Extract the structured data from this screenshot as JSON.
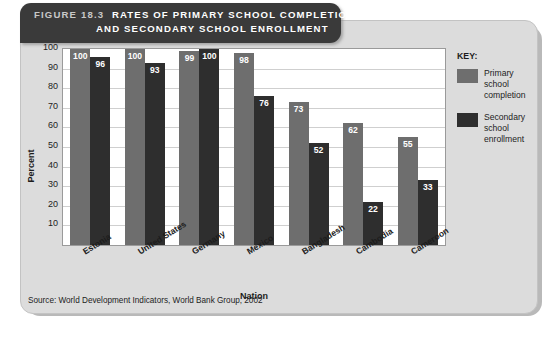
{
  "figure": {
    "number_label": "FIGURE 18.3",
    "title_line1": "RATES OF PRIMARY SCHOOL COMPLETION",
    "title_line2": "AND SECONDARY SCHOOL ENROLLMENT",
    "source": "Source: World Development Indicators, World Bank Group, 2002"
  },
  "legend": {
    "title": "KEY:",
    "items": [
      {
        "label": "Primary school completion",
        "color": "#6e6e6e"
      },
      {
        "label": "Secondary school enrollment",
        "color": "#2e2e2e"
      }
    ]
  },
  "chart_data": {
    "type": "bar",
    "title": "RATES OF PRIMARY SCHOOL COMPLETION AND SECONDARY SCHOOL ENROLLMENT",
    "xlabel": "Nation",
    "ylabel": "Percent",
    "ylim": [
      0,
      100
    ],
    "yticks": [
      10,
      20,
      30,
      40,
      50,
      60,
      70,
      80,
      90,
      100
    ],
    "ytick_labels": [
      "10",
      "20",
      "30",
      "40",
      "50",
      "60",
      "70",
      "80",
      "90",
      "100"
    ],
    "grid": true,
    "legend_position": "right",
    "categories": [
      "Estonia",
      "United States",
      "Germany",
      "Mexico",
      "Bangladesh",
      "Cambodia",
      "Cameroon"
    ],
    "series": [
      {
        "name": "Primary school completion",
        "color": "#6e6e6e",
        "values": [
          100,
          100,
          99,
          98,
          73,
          62,
          55
        ]
      },
      {
        "name": "Secondary school enrollment",
        "color": "#2e2e2e",
        "values": [
          96,
          93,
          100,
          76,
          52,
          22,
          33
        ]
      }
    ]
  }
}
